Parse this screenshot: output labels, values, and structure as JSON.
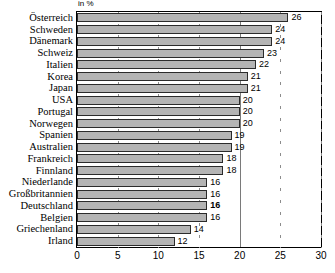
{
  "chart_data": {
    "type": "bar",
    "orientation": "horizontal",
    "title": "",
    "subtitle": "",
    "unit_caption": "in %",
    "xlabel": "",
    "ylabel": "",
    "xlim": [
      0,
      30
    ],
    "xticks": [
      0,
      5,
      10,
      15,
      20,
      25,
      30
    ],
    "grid": true,
    "gridlines_x": [
      20
    ],
    "legend": false,
    "legend_position": "none",
    "categories": [
      "Österreich",
      "Schweden",
      "Dänemark",
      "Schweiz",
      "Italien",
      "Korea",
      "Japan",
      "USA",
      "Portugal",
      "Norwegen",
      "Spanien",
      "Australien",
      "Frankreich",
      "Finnland",
      "Niederlande",
      "Großbritannien",
      "Deutschland",
      "Belgien",
      "Griechenland",
      "Irland"
    ],
    "values": [
      26,
      24,
      24,
      23,
      22,
      21,
      21,
      20,
      20,
      20,
      19,
      19,
      18,
      18,
      16,
      16,
      16,
      16,
      14,
      12
    ],
    "value_labels": [
      "26",
      "24",
      "24",
      "23",
      "22",
      "21",
      "21",
      "20",
      "20",
      "20",
      "19",
      "19",
      "18",
      "18",
      "16",
      "16",
      "16",
      "16",
      "14",
      "12"
    ],
    "highlighted_category": "Deutschland",
    "highlight_style": "bold-value-label",
    "colors": {
      "bar_fill": "#b4b4b4",
      "bar_border": "#2b2b2b",
      "frame": "#000000",
      "gridline": "#7a7a7a",
      "text": "#000000",
      "background": "#ffffff"
    }
  }
}
